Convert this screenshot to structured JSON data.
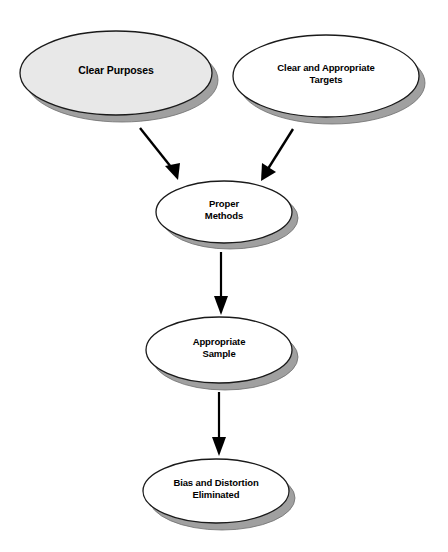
{
  "diagram": {
    "type": "flowchart",
    "background_color": "#ffffff",
    "palette": {
      "ellipse_stroke": "#1a1a1a",
      "ellipse_fill_default": "#ffffff",
      "ellipse_fill_highlight": "#e8e8e8",
      "shadow_fill": "#a0a0a0",
      "arrow_color": "#000000",
      "text_color": "#000000"
    },
    "nodes": [
      {
        "id": "clear-purposes",
        "label": "Clear Purposes",
        "fill": "#e8e8e8",
        "cx": 116,
        "cy": 73,
        "rx": 96,
        "ry": 42,
        "font_size": 10.5,
        "text_x": 20,
        "text_y": 66,
        "text_w": 192
      },
      {
        "id": "clear-and-appropriate-targets",
        "label": "Clear and Appropriate\nTargets",
        "fill": "#ffffff",
        "cx": 326,
        "cy": 76,
        "rx": 93,
        "ry": 41,
        "font_size": 9.5,
        "text_x": 233,
        "text_y": 63,
        "text_w": 186
      },
      {
        "id": "proper-methods",
        "label": "Proper\nMethods",
        "fill": "#ffffff",
        "cx": 224,
        "cy": 212,
        "rx": 68,
        "ry": 31,
        "font_size": 9.5,
        "text_x": 156,
        "text_y": 199,
        "text_w": 136
      },
      {
        "id": "appropriate-sample",
        "label": "Appropriate\nSample",
        "fill": "#ffffff",
        "cx": 219,
        "cy": 350,
        "rx": 73,
        "ry": 33,
        "font_size": 9.5,
        "text_x": 146,
        "text_y": 337,
        "text_w": 146
      },
      {
        "id": "bias-and-distortion-eliminated",
        "label": "Bias and Distortion\nEliminated",
        "fill": "#ffffff",
        "cx": 216,
        "cy": 491,
        "rx": 73,
        "ry": 32,
        "font_size": 9.5,
        "text_x": 143,
        "text_y": 478,
        "text_w": 146
      }
    ],
    "edges": [
      {
        "id": "edge-purposes-to-methods",
        "from": "clear-purposes",
        "to": "proper-methods",
        "kind": "diagonal-down-right",
        "x1": 140,
        "y1": 128,
        "x2": 178,
        "y2": 178
      },
      {
        "id": "edge-targets-to-methods",
        "from": "clear-and-appropriate-targets",
        "to": "proper-methods",
        "kind": "diagonal-down-left",
        "x1": 292,
        "y1": 129,
        "x2": 262,
        "y2": 180
      },
      {
        "id": "edge-methods-to-sample",
        "from": "proper-methods",
        "to": "appropriate-sample",
        "kind": "vertical",
        "x1": 221,
        "y1": 252,
        "x2": 221,
        "y2": 314
      },
      {
        "id": "edge-sample-to-bias",
        "from": "appropriate-sample",
        "to": "bias-and-distortion-eliminated",
        "kind": "vertical",
        "x1": 219,
        "y1": 392,
        "x2": 219,
        "y2": 455
      }
    ]
  }
}
